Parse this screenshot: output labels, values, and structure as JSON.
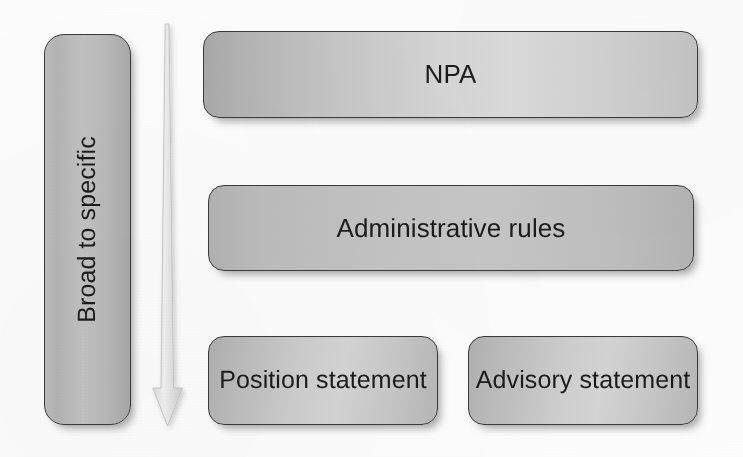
{
  "diagram": {
    "background_color": "#fdfdfd",
    "node_border_color": "#3a3a3a",
    "node_text_color": "#1b1b1b",
    "arrow": {
      "icon": "down-arrow-icon",
      "direction": "down",
      "label": "",
      "fill_color": "#e9e9e9",
      "stroke_color": "#c9c9c9"
    },
    "axis": {
      "label": "Broad to specific",
      "orientation": "vertical-bottom-to-top",
      "fill_color": "#bdbdbd"
    },
    "levels": [
      {
        "level": 1,
        "nodes": [
          {
            "label": "NPA",
            "fill_color": "#cfcfcf"
          }
        ]
      },
      {
        "level": 2,
        "nodes": [
          {
            "label": "Administrative rules",
            "fill_color": "#c4c4c4"
          }
        ]
      },
      {
        "level": 3,
        "nodes": [
          {
            "label": "Position statement",
            "fill_color": "#c9c9c9"
          },
          {
            "label": "Advisory statement",
            "fill_color": "#c9c9c9"
          }
        ]
      }
    ]
  }
}
